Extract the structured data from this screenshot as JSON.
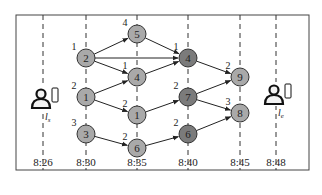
{
  "diagram": {
    "type": "time-expanded network",
    "frame": {
      "x": 16,
      "y": 15,
      "width": 293,
      "height": 155
    },
    "colors": {
      "node_light": "#a9a9a9",
      "node_dark": "#7b7b7b",
      "stroke": "#222222",
      "dashed": "#333333",
      "text": "#222222"
    },
    "timeline": [
      {
        "label": "8:26",
        "x": 43
      },
      {
        "label": "8:30",
        "x": 86
      },
      {
        "label": "8:35",
        "x": 137
      },
      {
        "label": "8:40",
        "x": 188
      },
      {
        "label": "8:45",
        "x": 240
      },
      {
        "label": "8:48",
        "x": 276
      }
    ],
    "endpoints": [
      {
        "id": "source",
        "label": "l",
        "subscript": "s",
        "x": 43,
        "y": 100
      },
      {
        "id": "destination",
        "label": "l",
        "subscript": "e",
        "x": 276,
        "y": 96
      }
    ],
    "nodes": [
      {
        "id": "n2_830",
        "label": "2",
        "weight": "1",
        "x": 86,
        "y": 58,
        "shade": "light"
      },
      {
        "id": "n1_830",
        "label": "1",
        "weight": "2",
        "x": 86,
        "y": 97,
        "shade": "light"
      },
      {
        "id": "n3_830",
        "label": "3",
        "weight": "3",
        "x": 86,
        "y": 134,
        "shade": "light"
      },
      {
        "id": "n5_835",
        "label": "5",
        "weight": "4",
        "x": 137,
        "y": 34,
        "shade": "light"
      },
      {
        "id": "n4_835",
        "label": "4",
        "weight": "1",
        "x": 137,
        "y": 77,
        "shade": "light"
      },
      {
        "id": "n1_835",
        "label": "1",
        "weight": "2",
        "x": 137,
        "y": 115,
        "shade": "light"
      },
      {
        "id": "n6_835",
        "label": "6",
        "weight": "2",
        "x": 137,
        "y": 148,
        "shade": "light"
      },
      {
        "id": "n4_840",
        "label": "4",
        "weight": "1",
        "x": 188,
        "y": 58,
        "shade": "dark"
      },
      {
        "id": "n7_840",
        "label": "7",
        "weight": "2",
        "x": 188,
        "y": 97,
        "shade": "dark"
      },
      {
        "id": "n6_840",
        "label": "6",
        "weight": "2",
        "x": 188,
        "y": 134,
        "shade": "dark"
      },
      {
        "id": "n9_845",
        "label": "9",
        "weight": "2",
        "x": 240,
        "y": 77,
        "shade": "light"
      },
      {
        "id": "n8_845",
        "label": "8",
        "weight": "3",
        "x": 240,
        "y": 113,
        "shade": "light"
      }
    ],
    "edges": [
      {
        "from": "n2_830",
        "to": "n5_835"
      },
      {
        "from": "n2_830",
        "to": "n4_840"
      },
      {
        "from": "n2_830",
        "to": "n4_835"
      },
      {
        "from": "n1_830",
        "to": "n4_835"
      },
      {
        "from": "n1_830",
        "to": "n1_835"
      },
      {
        "from": "n3_830",
        "to": "n6_835"
      },
      {
        "from": "n5_835",
        "to": "n4_840"
      },
      {
        "from": "n4_835",
        "to": "n4_840"
      },
      {
        "from": "n1_835",
        "to": "n7_840"
      },
      {
        "from": "n6_835",
        "to": "n6_840"
      },
      {
        "from": "n4_840",
        "to": "n9_845"
      },
      {
        "from": "n7_840",
        "to": "n9_845"
      },
      {
        "from": "n7_840",
        "to": "n8_845"
      },
      {
        "from": "n6_840",
        "to": "n8_845"
      }
    ]
  }
}
